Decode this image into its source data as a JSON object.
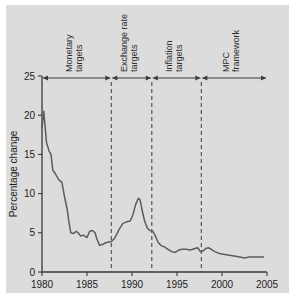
{
  "chart_data": {
    "type": "line",
    "title": "",
    "xlabel": "",
    "ylabel": "Percentage change",
    "xlim": [
      1980,
      2005
    ],
    "ylim": [
      0,
      25
    ],
    "grid": false,
    "legend": null,
    "x_ticks": [
      "1980",
      "1985",
      "1990",
      "1995",
      "2000",
      "2005"
    ],
    "x_tick_values": [
      1980,
      1985,
      1990,
      1995,
      2000,
      2005
    ],
    "y_ticks": [
      "0",
      "5",
      "10",
      "15",
      "20",
      "25"
    ],
    "y_tick_values": [
      0,
      5,
      10,
      15,
      20,
      25
    ],
    "series": [
      {
        "name": "Percentage change",
        "color": "#5c5c5c",
        "points": [
          [
            1980.0,
            18.4
          ],
          [
            1980.2,
            20.5
          ],
          [
            1980.5,
            16.5
          ],
          [
            1980.8,
            15.4
          ],
          [
            1981.0,
            15.0
          ],
          [
            1981.2,
            13.0
          ],
          [
            1981.5,
            12.5
          ],
          [
            1981.8,
            11.9
          ],
          [
            1982.0,
            11.6
          ],
          [
            1982.2,
            11.5
          ],
          [
            1982.5,
            9.6
          ],
          [
            1982.8,
            8.0
          ],
          [
            1983.0,
            6.3
          ],
          [
            1983.2,
            5.0
          ],
          [
            1983.5,
            4.9
          ],
          [
            1983.8,
            5.2
          ],
          [
            1984.0,
            5.0
          ],
          [
            1984.3,
            4.6
          ],
          [
            1984.6,
            4.7
          ],
          [
            1985.0,
            4.4
          ],
          [
            1985.3,
            5.2
          ],
          [
            1985.6,
            5.3
          ],
          [
            1985.9,
            5.0
          ],
          [
            1986.1,
            4.2
          ],
          [
            1986.4,
            3.4
          ],
          [
            1986.7,
            3.5
          ],
          [
            1987.0,
            3.7
          ],
          [
            1987.3,
            3.8
          ],
          [
            1987.7,
            3.9
          ],
          [
            1988.0,
            4.2
          ],
          [
            1988.3,
            4.8
          ],
          [
            1988.6,
            5.5
          ],
          [
            1989.0,
            6.2
          ],
          [
            1989.4,
            6.4
          ],
          [
            1989.8,
            6.5
          ],
          [
            1990.1,
            7.3
          ],
          [
            1990.4,
            8.6
          ],
          [
            1990.7,
            9.4
          ],
          [
            1990.9,
            9.2
          ],
          [
            1991.1,
            8.0
          ],
          [
            1991.4,
            6.5
          ],
          [
            1991.7,
            5.6
          ],
          [
            1992.0,
            5.3
          ],
          [
            1992.3,
            5.2
          ],
          [
            1992.6,
            4.6
          ],
          [
            1992.9,
            3.8
          ],
          [
            1993.2,
            3.4
          ],
          [
            1993.6,
            3.2
          ],
          [
            1994.0,
            2.9
          ],
          [
            1994.4,
            2.6
          ],
          [
            1994.8,
            2.5
          ],
          [
            1995.2,
            2.8
          ],
          [
            1995.6,
            2.9
          ],
          [
            1996.0,
            2.9
          ],
          [
            1996.5,
            2.8
          ],
          [
            1997.0,
            3.0
          ],
          [
            1997.3,
            3.1
          ],
          [
            1997.6,
            2.6
          ],
          [
            1997.9,
            2.7
          ],
          [
            1998.2,
            3.0
          ],
          [
            1998.5,
            3.1
          ],
          [
            1998.8,
            2.9
          ],
          [
            1999.2,
            2.6
          ],
          [
            1999.6,
            2.4
          ],
          [
            2000.0,
            2.3
          ],
          [
            2000.5,
            2.2
          ],
          [
            2001.0,
            2.1
          ],
          [
            2001.5,
            2.0
          ],
          [
            2002.0,
            1.9
          ],
          [
            2002.5,
            1.8
          ],
          [
            2003.0,
            1.9
          ],
          [
            2003.5,
            1.9
          ],
          [
            2004.0,
            1.9
          ],
          [
            2004.6,
            1.9
          ]
        ]
      }
    ],
    "dividers": [
      1987.7,
      1992.2,
      1997.7
    ],
    "regimes": [
      {
        "label": "Monetary targets",
        "start": 1980,
        "end": 1987.7
      },
      {
        "label": "Exchange rate targets",
        "start": 1987.7,
        "end": 1992.2
      },
      {
        "label": "Inflation targets",
        "start": 1992.2,
        "end": 1997.7
      },
      {
        "label": "MPC framework",
        "start": 1997.7,
        "end": 2005
      }
    ]
  },
  "colors": {
    "panel_background": "#dcdcdc",
    "page_background": "#ffffff",
    "axis": "#3a3a3a",
    "line": "#5c5c5c",
    "divider": "#4a4a4a",
    "text": "#1c1c1c"
  }
}
